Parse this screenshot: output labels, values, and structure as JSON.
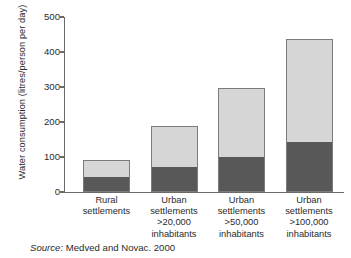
{
  "chart_data": {
    "type": "bar",
    "stacked": true,
    "title": "",
    "xlabel": "",
    "ylabel": "Water consumption (litres/person per day)",
    "ylim": [
      0,
      500
    ],
    "yticks": [
      0,
      100,
      200,
      300,
      400,
      500
    ],
    "ytick_labels": [
      "0",
      "100",
      "200",
      "300",
      "400",
      "500"
    ],
    "grid": false,
    "legend": "none",
    "categories": [
      "Rural settlements",
      "Urban settlements >20,000 inhabitants",
      "Urban settlements >50,000 inhabitants",
      "Urban settlements >100,000 inhabitants"
    ],
    "category_lines": [
      [
        "Rural",
        "settlements"
      ],
      [
        "Urban",
        "settlements",
        ">20,000",
        "inhabitants"
      ],
      [
        "Urban",
        "settlements",
        ">50,000",
        "inhabitants"
      ],
      [
        "Urban",
        "settlements",
        ">100,000",
        "inhabitants"
      ]
    ],
    "series": [
      {
        "name": "lower-segment",
        "color": "#585858",
        "values": [
          43,
          72,
          100,
          143
        ]
      },
      {
        "name": "upper-segment",
        "color": "#d6d6d6",
        "values": [
          48,
          117,
          197,
          295
        ]
      }
    ],
    "totals": [
      91,
      189,
      297,
      438
    ]
  },
  "source": {
    "label": "Source:",
    "text": "Medved and Novac. 2000"
  },
  "colors": {
    "dark_segment": "#585858",
    "light_segment": "#d6d6d6",
    "axis": "#6a6a6a",
    "bar_outline": "#7c7c7c",
    "text": "#2b2b2b",
    "background": "#ffffff"
  }
}
